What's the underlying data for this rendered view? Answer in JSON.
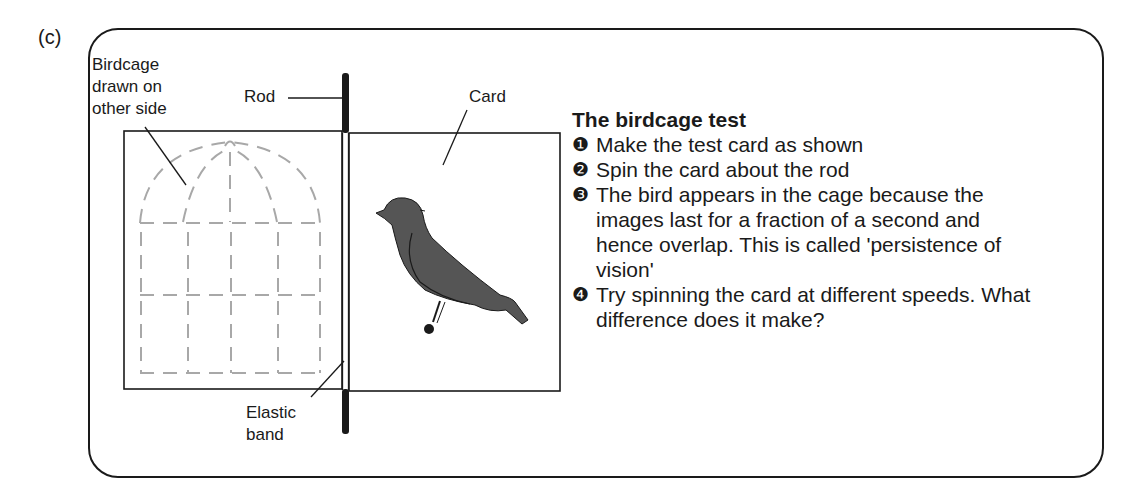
{
  "figure_label": "(c)",
  "labels": {
    "birdcage": [
      "Birdcage",
      "drawn on",
      "other side"
    ],
    "rod": "Rod",
    "card": "Card",
    "elastic_band": [
      "Elastic",
      "band"
    ]
  },
  "instructions": {
    "title": "The birdcage test",
    "steps": [
      {
        "number": "❶",
        "text": "Make the test card as shown"
      },
      {
        "number": "❷",
        "text": "Spin the card about the rod"
      },
      {
        "number": "❸",
        "text": "The bird appears in the cage because the images last for a fraction of a second and hence overlap. This is called 'persistence of vision'"
      },
      {
        "number": "❹",
        "text": "Try spinning the card at different speeds. What difference does it make?"
      }
    ]
  },
  "colors": {
    "line": "#1a1a1a",
    "cage": "#a8a8a8",
    "bird": "#555555"
  }
}
